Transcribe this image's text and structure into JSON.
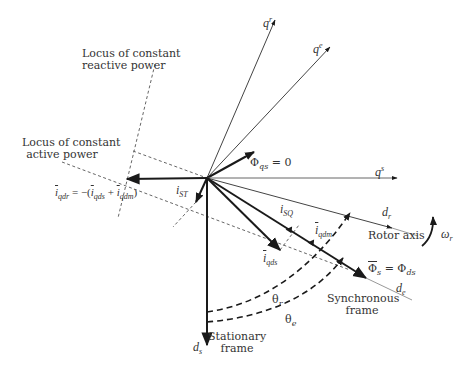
{
  "diagram": {
    "axes": {
      "q_r": {
        "label": "q",
        "superscript": "r"
      },
      "q_e": {
        "label": "q",
        "superscript": "e"
      },
      "q_s": {
        "label": "q",
        "superscript": "s"
      },
      "d_r": {
        "label": "d",
        "subscript": "r"
      },
      "d_e": {
        "label": "d",
        "subscript": "e"
      },
      "d_s": {
        "label": "d",
        "subscript": "s"
      }
    },
    "loci": {
      "reactive_line1": "Locus of constant",
      "reactive_line2": "reactive power",
      "active_line1": "Locus of constant",
      "active_line2": "active power"
    },
    "vectors": {
      "i_qdr_equation": {
        "lhs": "i",
        "lhs_sub": "qdr",
        "eq": " = −(",
        "t1": "i",
        "t1_sub": "qds",
        "plus": " + ",
        "t2": "i",
        "t2_sub": "qdm",
        "close": ")"
      },
      "i_ST": {
        "label": "i",
        "subscript": "ST"
      },
      "i_SQ": {
        "label": "i",
        "subscript": "SQ"
      },
      "i_qdm": {
        "label": "i",
        "subscript": "qdm"
      },
      "i_qds": {
        "label": "i",
        "subscript": "qds"
      },
      "phi_qs": {
        "label": "Φ",
        "subscript": "qs",
        "value": " = 0"
      },
      "phi_s": {
        "label": "Φ",
        "subscript": "s",
        "eq": " = Φ",
        "rhs_sub": "ds"
      }
    },
    "frames": {
      "rotor_axis": "Rotor axis",
      "synchronous_line1": "Synchronous",
      "synchronous_line2": "frame",
      "stationary_line1": "Stationary",
      "stationary_line2": "frame"
    },
    "angles": {
      "theta_r": {
        "label": "θ",
        "subscript": "r"
      },
      "theta_e": {
        "label": "θ",
        "subscript": "e"
      },
      "omega_r": {
        "label": "ω",
        "subscript": "r"
      }
    },
    "colors": {
      "stroke": "#1a1a1a",
      "thin_stroke": "#555555",
      "dashed": "#666666",
      "text": "#333333"
    }
  }
}
